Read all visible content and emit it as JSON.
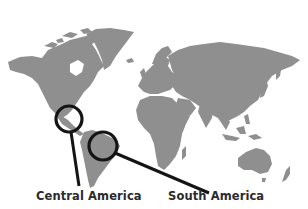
{
  "map": {
    "land_color": "#8f8f8f",
    "marker_color": "#141414",
    "background": "#ffffff"
  },
  "markers": [
    {
      "label": "Central America",
      "circle": {
        "cx": 69,
        "cy": 119,
        "r": 13
      },
      "leader": {
        "x1": 71,
        "y1": 132,
        "x2": 79,
        "y2": 186
      }
    },
    {
      "label": "South America",
      "circle": {
        "cx": 103,
        "cy": 146,
        "r": 14
      },
      "leader": {
        "x1": 115,
        "y1": 153,
        "x2": 209,
        "y2": 193
      }
    }
  ],
  "labels": {
    "central_america": "Central America",
    "south_america": "South America"
  }
}
